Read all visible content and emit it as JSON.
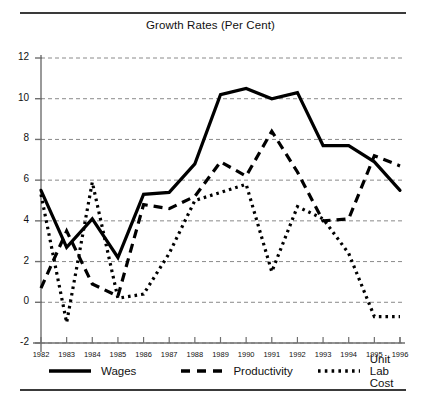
{
  "figure": {
    "title": "Growth Rates (Per Cent)"
  },
  "legend": {
    "items": [
      {
        "label": "Wages",
        "style": "solid",
        "icon": "solid-line-swatch"
      },
      {
        "label": "Productivity",
        "style": "dashed",
        "icon": "dashed-line-swatch"
      },
      {
        "label": "Unit Lab Cost",
        "style": "dotted",
        "icon": "dotted-line-swatch"
      }
    ]
  },
  "chart_data": {
    "type": "line",
    "title": "Growth Rates (Per Cent)",
    "xlabel": "",
    "ylabel": "",
    "x": [
      1982,
      1983,
      1984,
      1985,
      1986,
      1987,
      1988,
      1989,
      1990,
      1991,
      1992,
      1993,
      1994,
      1995,
      1996
    ],
    "categories": [
      "1982",
      "1983",
      "1984",
      "1985",
      "1986",
      "1987",
      "1988",
      "1989",
      "1990",
      "1991",
      "1992",
      "1993",
      "1994",
      "1995",
      "1996"
    ],
    "xlim": [
      1982,
      1996
    ],
    "ylim": [
      -2,
      12
    ],
    "yticks": [
      -2,
      0,
      2,
      4,
      6,
      8,
      10,
      12
    ],
    "ytick_labels": [
      "-2",
      "0",
      "2",
      "4",
      "6",
      "8",
      "10",
      "12"
    ],
    "grid": true,
    "grid_axis": "y",
    "grid_style": "dashed",
    "legend_position": "bottom",
    "series": [
      {
        "name": "Wages",
        "style": "solid",
        "values": [
          5.5,
          2.7,
          4.1,
          2.2,
          5.3,
          5.4,
          6.8,
          10.2,
          10.5,
          10.0,
          10.3,
          7.7,
          7.7,
          6.9,
          5.5
        ]
      },
      {
        "name": "Productivity",
        "style": "dashed",
        "values": [
          0.7,
          3.5,
          0.9,
          0.3,
          4.8,
          4.6,
          5.2,
          6.9,
          6.2,
          8.4,
          6.4,
          4.0,
          4.1,
          7.2,
          6.7
        ]
      },
      {
        "name": "Unit Lab Cost",
        "style": "dotted",
        "values": [
          5.3,
          -1.0,
          5.9,
          0.2,
          0.4,
          2.4,
          5.0,
          5.4,
          5.8,
          1.5,
          4.7,
          4.1,
          2.4,
          -0.7,
          -0.7
        ]
      }
    ]
  }
}
